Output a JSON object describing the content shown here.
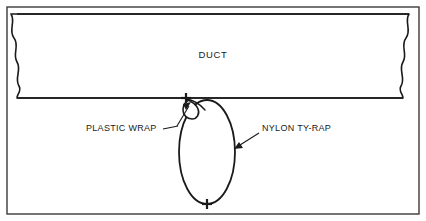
{
  "figure": {
    "kind": "technical-line-drawing",
    "background_color": "#ffffff",
    "line_color": "#1a1a1a",
    "frame": {
      "name": "outer-border",
      "x": 7,
      "y": 7,
      "width": 412,
      "height": 207,
      "stroke_width": 1.4
    },
    "duct": {
      "label": "DUCT",
      "label_x": 213,
      "label_y": 58,
      "top_y": 14,
      "bottom_y": 98,
      "left_break_x": 17,
      "right_break_x": 409,
      "stroke_width": 1.6,
      "break_edges": "wavy",
      "description": "Horizontal duct section drawn with wavy break lines on the left and right ends"
    },
    "ty_rap": {
      "label": "NYLON TY-RAP",
      "shape": "oval",
      "center_x": 207,
      "center_y": 152,
      "radius_x": 28,
      "radius_y": 52,
      "stroke_width": 1.8,
      "top_marker": "cross",
      "bottom_marker": "cross",
      "bottom_marker_x": 207,
      "bottom_marker_y": 204
    },
    "plastic_wrap": {
      "label": "PLASTIC WRAP",
      "shape": "small-folded-loop",
      "anchor_x": 190,
      "anchor_y": 100,
      "stroke_width": 1.6,
      "description": "Small folded flap of wrap material pinched between the duct underside and the ty-rap"
    },
    "callouts": [
      {
        "name": "plastic-wrap-callout",
        "text": "PLASTIC WRAP",
        "text_x": 86,
        "text_y": 131,
        "text_anchor": "start",
        "leader_from_x": 177,
        "leader_from_y": 125,
        "leader_to_x": 190,
        "leader_to_y": 105,
        "arrow_at": "end"
      },
      {
        "name": "nylon-ty-rap-callout",
        "text": "NYLON TY-RAP",
        "text_x": 262,
        "text_y": 131,
        "text_anchor": "start",
        "leader_from_x": 258,
        "leader_from_y": 134,
        "leader_to_x": 235,
        "leader_to_y": 148,
        "arrow_at": "end"
      }
    ],
    "markers": {
      "cross_arm": 5,
      "cross_stroke": 2.2
    }
  }
}
